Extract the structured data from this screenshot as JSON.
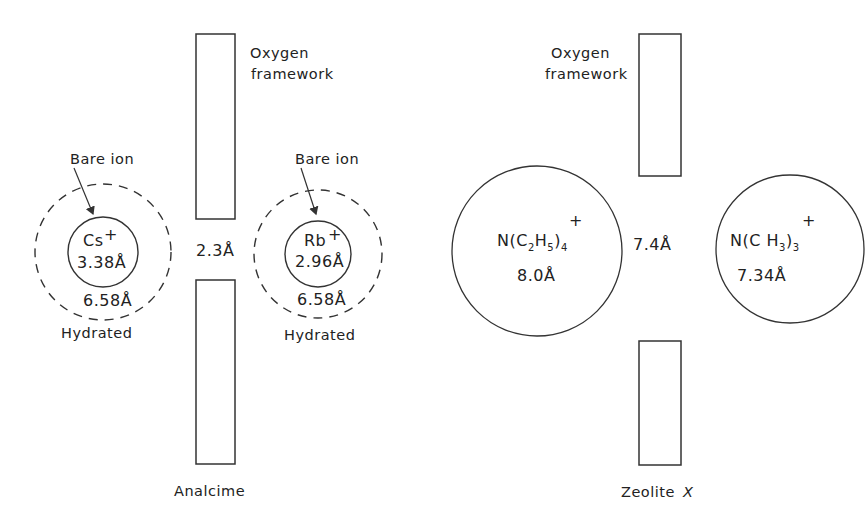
{
  "diagram": {
    "colors": {
      "line": "#333333",
      "text": "#222222",
      "background": "#ffffff"
    },
    "analcime": {
      "caption": "Analcime",
      "framework_label_line1": "Oxygen",
      "framework_label_line2": "framework",
      "aperture": "2.3Å",
      "cs_ion": {
        "bare_label": "Bare ion",
        "symbol": "Cs",
        "charge": "+",
        "bare_diameter": "3.38Å",
        "hydrated_diameter": "6.58Å",
        "hydrated_label": "Hydrated"
      },
      "rb_ion": {
        "bare_label": "Bare ion",
        "symbol": "Rb",
        "charge": "+",
        "bare_diameter": "2.96Å",
        "hydrated_diameter": "6.58Å",
        "hydrated_label": "Hydrated"
      }
    },
    "zeolite_x": {
      "caption_prefix": "Zeolite",
      "caption_italic": "X",
      "framework_label_line1": "Oxygen",
      "framework_label_line2": "framework",
      "aperture": "7.4Å",
      "tetraethylammonium": {
        "formula_n": "N(C",
        "sub1": "2",
        "formula_h": "H",
        "sub2": "5",
        "formula_close": ")",
        "sub3": "4",
        "charge": "+",
        "diameter": "8.0Å"
      },
      "trimethylammonium": {
        "formula_n": "N(C H",
        "sub1": "3",
        "formula_close": ")",
        "sub2": "3",
        "charge": "+",
        "diameter": "7.34Å"
      }
    }
  }
}
